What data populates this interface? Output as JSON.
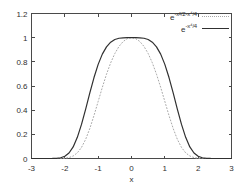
{
  "chart_data": {
    "type": "line",
    "title": "",
    "xlabel": "x",
    "ylabel": "",
    "xlim": [
      -3,
      3
    ],
    "ylim": [
      0,
      1.2
    ],
    "grid": false,
    "legend_position": "top-right-inside",
    "xticks": {
      "values": [
        -3,
        -2,
        -1,
        0,
        1,
        2,
        3
      ],
      "labels": [
        "-3",
        "-2",
        "-1",
        "0",
        "1",
        "2",
        "3"
      ]
    },
    "yticks": {
      "values": [
        0,
        0.2,
        0.4,
        0.6,
        0.8,
        1,
        1.2
      ],
      "labels": [
        "0",
        "0.2",
        "0.4",
        "0.6",
        "0.8",
        "1",
        "1.2"
      ]
    },
    "x": [
      -3,
      -2.875,
      -2.75,
      -2.625,
      -2.5,
      -2.375,
      -2.25,
      -2.125,
      -2,
      -1.875,
      -1.75,
      -1.625,
      -1.5,
      -1.375,
      -1.25,
      -1.125,
      -1,
      -0.875,
      -0.75,
      -0.625,
      -0.5,
      -0.375,
      -0.25,
      -0.125,
      0,
      0.125,
      0.25,
      0.375,
      0.5,
      0.625,
      0.75,
      0.875,
      1,
      1.125,
      1.25,
      1.375,
      1.5,
      1.625,
      1.75,
      1.875,
      2,
      2.125,
      2.25,
      2.375,
      2.5,
      2.625,
      2.75,
      2.875,
      3
    ],
    "series": [
      {
        "label_base": "e",
        "label_exponent": "-x²/2-x⁴/4",
        "style": "dotted",
        "color": "#a8a8a8",
        "values": [
          0,
          0,
          0,
          0,
          0,
          2e-05,
          0.00013,
          0.00064,
          0.00248,
          0.00785,
          0.02076,
          0.04674,
          0.09162,
          0.15896,
          0.24869,
          0.35582,
          0.47237,
          0.58899,
          0.69744,
          0.79179,
          0.86881,
          0.92751,
          0.96829,
          0.99216,
          1,
          0.99216,
          0.96829,
          0.92751,
          0.86881,
          0.79179,
          0.69744,
          0.58899,
          0.47237,
          0.35582,
          0.24869,
          0.15896,
          0.09162,
          0.04674,
          0.02076,
          0.00785,
          0.00248,
          0.00064,
          0.00013,
          2e-05,
          0,
          0,
          0,
          0,
          0
        ]
      },
      {
        "label_base": "e",
        "label_exponent": "-x⁴/4",
        "style": "solid",
        "color": "#303030",
        "values": [
          0,
          0,
          0,
          1e-05,
          6e-05,
          0.00035,
          0.00165,
          0.00612,
          0.01832,
          0.04552,
          0.0959,
          0.17497,
          0.28206,
          0.40916,
          0.54316,
          0.67002,
          0.7788,
          0.86369,
          0.92395,
          0.96257,
          0.9845,
          0.99507,
          0.99902,
          0.99994,
          1,
          0.99994,
          0.99902,
          0.99507,
          0.9845,
          0.96257,
          0.92395,
          0.86369,
          0.7788,
          0.67002,
          0.54316,
          0.40916,
          0.28206,
          0.17497,
          0.0959,
          0.04552,
          0.01832,
          0.00612,
          0.00165,
          0.00035,
          6e-05,
          1e-05,
          0,
          0,
          0
        ]
      }
    ],
    "colors": {
      "frame": "#4a4a4a",
      "text": "#303030",
      "background": "#ffffff"
    }
  }
}
